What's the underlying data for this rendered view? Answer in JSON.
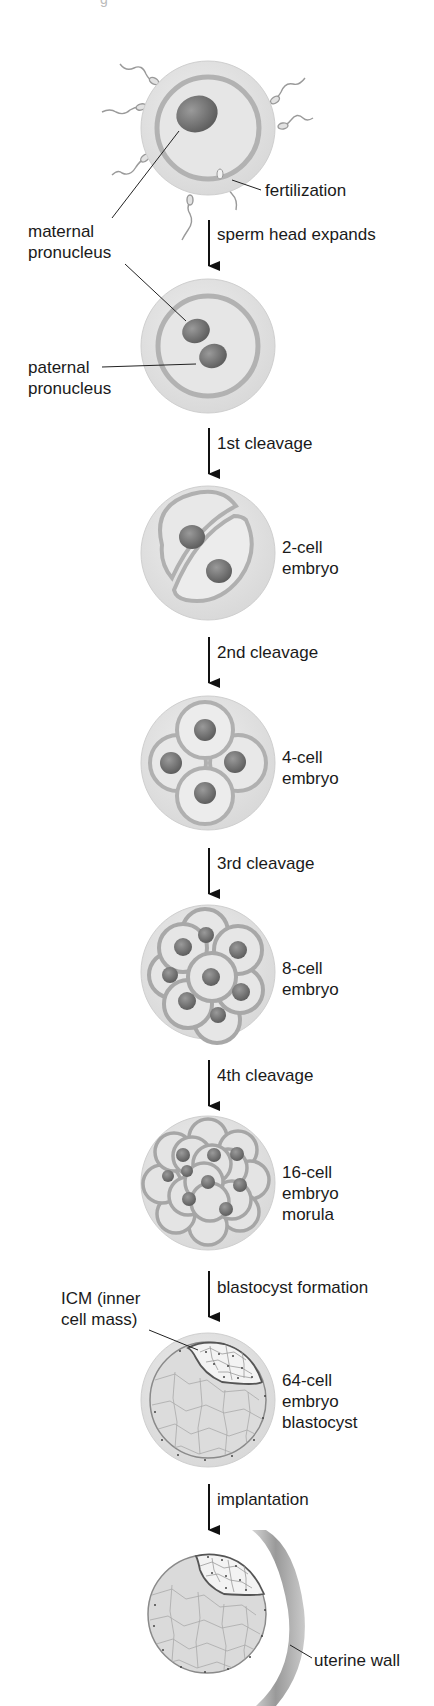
{
  "figure": {
    "title_fragment": "g",
    "background": "#ffffff",
    "colors": {
      "zona": "#e4e4e4",
      "zona_edge": "#c8c8c8",
      "membrane": "#b4b4b4",
      "cytoplasm": "#e9e9e9",
      "nucleus": "#7a7a7a",
      "icm": "#f4f4f4",
      "trophoblast_line": "#777777",
      "uterine_wall": "#9a9a9a",
      "arrow": "#111111",
      "text": "#1a1a1a"
    }
  },
  "stages": [
    {
      "id": "oocyte",
      "labels": [],
      "callouts": [
        "fertilization",
        "maternal pronucleus"
      ]
    },
    {
      "id": "zygote",
      "labels": [],
      "callouts": [
        "paternal pronucleus"
      ]
    },
    {
      "id": "2-cell",
      "labels": [
        "2-cell",
        "embryo"
      ]
    },
    {
      "id": "4-cell",
      "labels": [
        "4-cell",
        "embryo"
      ]
    },
    {
      "id": "8-cell",
      "labels": [
        "8-cell",
        "embryo"
      ]
    },
    {
      "id": "16-cell",
      "labels": [
        "16-cell",
        "embryo",
        "morula"
      ]
    },
    {
      "id": "64-cell",
      "labels": [
        "64-cell",
        "embryo",
        "blastocyst"
      ],
      "callouts": [
        "ICM (inner",
        "cell mass)"
      ]
    },
    {
      "id": "implantation",
      "labels": [],
      "callouts": [
        "uterine wall"
      ]
    }
  ],
  "callouts": {
    "fertilization": "fertilization",
    "maternal_line1": "maternal",
    "maternal_line2": "pronucleus",
    "paternal_line1": "paternal",
    "paternal_line2": "pronucleus",
    "icm_line1": "ICM (inner",
    "icm_line2": "cell mass)",
    "uterine_wall": "uterine wall"
  },
  "stage_labels": {
    "two_cell": [
      "2-cell",
      "embryo"
    ],
    "four_cell": [
      "4-cell",
      "embryo"
    ],
    "eight_cell": [
      "8-cell",
      "embryo"
    ],
    "sixteen_cell": [
      "16-cell",
      "embryo",
      "morula"
    ],
    "sixty_four_cell": [
      "64-cell",
      "embryo",
      "blastocyst"
    ]
  },
  "arrows": [
    {
      "label": "sperm head expands"
    },
    {
      "label": "1st cleavage"
    },
    {
      "label": "2nd cleavage"
    },
    {
      "label": "3rd cleavage"
    },
    {
      "label": "4th cleavage"
    },
    {
      "label": "blastocyst formation"
    },
    {
      "label": "implantation"
    }
  ]
}
